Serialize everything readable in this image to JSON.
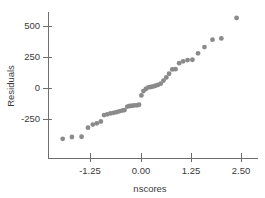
{
  "chart_data": {
    "type": "scatter",
    "title": "",
    "xlabel": "nscores",
    "ylabel": "Residuals",
    "xlim": [
      -2.05,
      2.7
    ],
    "ylim": [
      -430,
      640
    ],
    "grid": false,
    "legend": null,
    "xticks": [
      -1.25,
      0.0,
      1.25,
      2.5
    ],
    "xtick_labels": [
      "-1.25",
      "0.00",
      "1.25",
      "2.50"
    ],
    "yticks": [
      -250,
      0,
      250,
      500
    ],
    "ytick_labels": [
      "-250",
      "0",
      "250",
      "500"
    ],
    "point_color": "#8a8a8a",
    "axis_color": "#6e6e6e",
    "marker_size": 2.4,
    "x": [
      -1.95,
      -1.72,
      -1.48,
      -1.32,
      -1.2,
      -1.1,
      -1.0,
      -0.92,
      -0.84,
      -0.76,
      -0.68,
      -0.61,
      -0.54,
      -0.47,
      -0.41,
      -0.34,
      -0.28,
      -0.22,
      -0.16,
      -0.1,
      -0.05,
      0.01,
      0.06,
      0.12,
      0.18,
      0.24,
      0.3,
      0.36,
      0.42,
      0.49,
      0.56,
      0.63,
      0.7,
      0.78,
      0.86,
      0.95,
      1.05,
      1.16,
      1.28,
      1.42,
      1.58,
      1.78,
      2.0,
      2.38
    ],
    "y": [
      -410,
      -395,
      -393,
      -320,
      -295,
      -285,
      -270,
      -218,
      -212,
      -205,
      -200,
      -195,
      -188,
      -182,
      -178,
      -150,
      -145,
      -143,
      -140,
      -140,
      -135,
      -60,
      -25,
      -8,
      5,
      8,
      12,
      18,
      25,
      35,
      60,
      85,
      115,
      150,
      152,
      200,
      215,
      225,
      228,
      280,
      330,
      390,
      400,
      565,
      605
    ]
  }
}
